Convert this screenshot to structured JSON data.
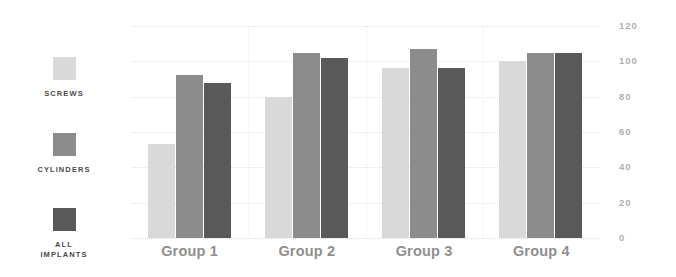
{
  "chart_data": {
    "type": "bar",
    "title": "",
    "subtitle": "",
    "xlabel": "",
    "ylabel": "",
    "ylim": [
      0,
      120
    ],
    "ytick_values": [
      120,
      100,
      80,
      60,
      40,
      20,
      0
    ],
    "ytick_labels": [
      "120",
      "100",
      "80",
      "60",
      "40",
      "20",
      "0"
    ],
    "grid": true,
    "grid_axis": "y",
    "legend_position": "left",
    "orientation": "vertical",
    "categories": [
      "Group 1",
      "Group 2",
      "Group 3",
      "Group 4"
    ],
    "series": [
      {
        "name": "SCREWS",
        "label_lines": "SCREWS",
        "color": "#d9d9d9",
        "values": [
          53,
          80,
          96,
          100
        ]
      },
      {
        "name": "CYLINDERS",
        "label_lines": "CYLINDERS",
        "color": "#8c8c8c",
        "values": [
          92,
          105,
          107,
          105
        ]
      },
      {
        "name": "ALL IMPLANTS",
        "label_lines": "ALL\nIMPLANTS",
        "color": "#595959",
        "values": [
          88,
          102,
          96,
          105
        ]
      }
    ]
  },
  "legend": {
    "items": [
      {
        "label": "SCREWS",
        "color": "#d9d9d9",
        "swatch_name": "legend-swatch-screws"
      },
      {
        "label": "CYLINDERS",
        "color": "#8c8c8c",
        "swatch_name": "legend-swatch-cylinders"
      },
      {
        "label": "ALL\nIMPLANTS",
        "color": "#595959",
        "swatch_name": "legend-swatch-all-implants"
      }
    ]
  },
  "axis": {
    "y_labels": [
      "120",
      "100",
      "80",
      "60",
      "40",
      "20",
      "0"
    ],
    "x_labels": [
      "Group 1",
      "Group 2",
      "Group 3",
      "Group 4"
    ]
  },
  "colors": {
    "series_light": "#d9d9d9",
    "series_medium": "#8c8c8c",
    "series_dark": "#595959",
    "gridline": "#e2e2e2",
    "ytick_text": "#b0b0b0",
    "xtick_text": "#8f8f8f",
    "legend_text": "#4a4a4a",
    "background": "#ffffff"
  }
}
